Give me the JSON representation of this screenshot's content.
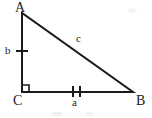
{
  "figure": {
    "background_color": "#ffffff",
    "stroke_color": "#1a1a1a",
    "stroke_width": 2,
    "width": 152,
    "height": 118
  },
  "vertices": {
    "A": {
      "label": "A",
      "x": 22,
      "y": 13
    },
    "B": {
      "label": "B",
      "x": 133,
      "y": 92
    },
    "C": {
      "label": "C",
      "x": 22,
      "y": 92
    }
  },
  "sides": {
    "a": {
      "label": "a",
      "from": "C",
      "to": "B",
      "tick_marks": 2
    },
    "b": {
      "label": "b",
      "from": "C",
      "to": "A",
      "tick_marks": 1
    },
    "c": {
      "label": "c",
      "from": "A",
      "to": "B",
      "tick_marks": 0
    }
  },
  "angles": {
    "C": {
      "type": "right-angle",
      "marker": "square",
      "size": 7
    }
  },
  "geometry": {
    "triangle_points": "22,13 22,92 133,92",
    "leg_vertical": {
      "x1": 22,
      "y1": 13,
      "x2": 22,
      "y2": 92
    },
    "leg_horizontal": {
      "x1": 22,
      "y1": 92,
      "x2": 133,
      "y2": 92
    },
    "hypotenuse": {
      "x1": 22,
      "y1": 13,
      "x2": 133,
      "y2": 92
    },
    "right_angle_path": "M 22 85 L 29 85 L 29 92",
    "tick_b": {
      "x1": 16,
      "y1": 51,
      "x2": 28,
      "y2": 51
    },
    "tick_a1": {
      "x1": 73,
      "y1": 86,
      "x2": 73,
      "y2": 97
    },
    "tick_a2": {
      "x1": 80,
      "y1": 86,
      "x2": 80,
      "y2": 97
    }
  }
}
